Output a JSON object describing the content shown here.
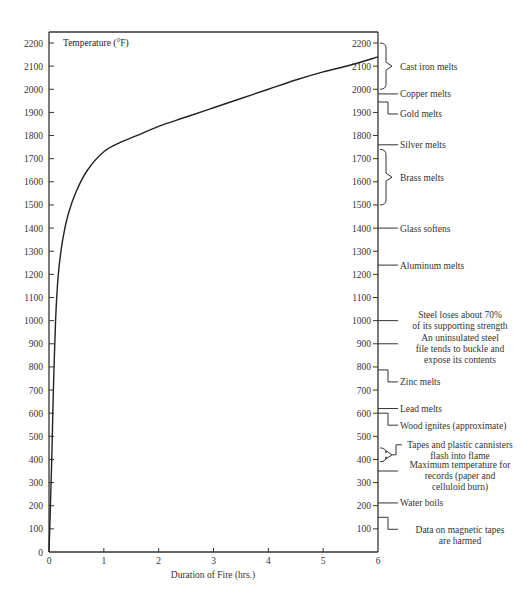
{
  "chart_data": {
    "type": "line",
    "title": "Temperature (°F)",
    "xlabel": "Duration of Fire (hrs.)",
    "ylabel": "Temperature (°F)",
    "xlim": [
      0,
      6
    ],
    "ylim": [
      0,
      2200
    ],
    "x_ticks": [
      "0",
      "1",
      "2",
      "3",
      "4",
      "5",
      "6"
    ],
    "y_ticks": [
      "0",
      "100",
      "200",
      "300",
      "400",
      "500",
      "600",
      "700",
      "800",
      "900",
      "1000",
      "1100",
      "1200",
      "1300",
      "1400",
      "1500",
      "1600",
      "1700",
      "1800",
      "1900",
      "2000",
      "2100",
      "2200"
    ],
    "right_y_ticks": [
      "100",
      "200",
      "300",
      "400",
      "500",
      "600",
      "700",
      "800",
      "900",
      "1000",
      "1100",
      "1200",
      "1300",
      "1400",
      "1500",
      "1600",
      "1700",
      "1800",
      "1900",
      "2000",
      "2100",
      "2200"
    ],
    "grid": false,
    "series": [
      {
        "name": "Fire temperature curve",
        "x": [
          0,
          0.02,
          0.05,
          0.08,
          0.12,
          0.17,
          0.25,
          0.35,
          0.5,
          0.7,
          1.0,
          1.3,
          1.6,
          2.0,
          2.5,
          3.0,
          3.5,
          4.0,
          4.5,
          5.0,
          5.5,
          6.0
        ],
        "y": [
          0,
          150,
          400,
          700,
          1000,
          1200,
          1350,
          1460,
          1560,
          1650,
          1730,
          1770,
          1800,
          1840,
          1880,
          1920,
          1960,
          2000,
          2040,
          2075,
          2105,
          2140
        ]
      }
    ],
    "annotations": [
      {
        "label": [
          "Cast iron melts"
        ],
        "kind": "brace",
        "range": [
          2000,
          2200
        ]
      },
      {
        "label": [
          "Copper melts"
        ],
        "kind": "line",
        "range": [
          1980,
          1980
        ]
      },
      {
        "label": [
          "Gold melts"
        ],
        "kind": "step",
        "range": [
          1945,
          1945
        ]
      },
      {
        "label": [
          "Silver melts"
        ],
        "kind": "line",
        "range": [
          1760,
          1760
        ]
      },
      {
        "label": [
          "Brass melts"
        ],
        "kind": "brace",
        "range": [
          1500,
          1740
        ]
      },
      {
        "label": [
          "Glass softens"
        ],
        "kind": "line",
        "range": [
          1400,
          1400
        ]
      },
      {
        "label": [
          "Aluminum melts"
        ],
        "kind": "line",
        "range": [
          1240,
          1240
        ]
      },
      {
        "label": [
          "Steel loses about 70%",
          "of its supporting strength"
        ],
        "kind": "line",
        "range": [
          1000,
          1000
        ]
      },
      {
        "label": [
          "An uninsulated steel",
          "file tends to buckle and",
          "expose its contents"
        ],
        "kind": "line",
        "range": [
          900,
          900
        ]
      },
      {
        "label": [
          "Zinc melts"
        ],
        "kind": "step",
        "range": [
          787,
          787
        ]
      },
      {
        "label": [
          "Lead melts"
        ],
        "kind": "line",
        "range": [
          620,
          620
        ]
      },
      {
        "label": [
          "Wood ignites (approximate)"
        ],
        "kind": "step",
        "range": [
          600,
          600
        ]
      },
      {
        "label": [
          "Tapes and plastic cannisters",
          "flash into flame"
        ],
        "kind": "brace",
        "range": [
          390,
          450
        ]
      },
      {
        "label": [
          "Maximum temperature for",
          "records (paper and",
          "celluloid burn)"
        ],
        "kind": "line",
        "range": [
          350,
          350
        ]
      },
      {
        "label": [
          "Water boils"
        ],
        "kind": "line",
        "range": [
          212,
          212
        ]
      },
      {
        "label": [
          "Data on magnetic tapes",
          "are harmed"
        ],
        "kind": "step",
        "range": [
          150,
          150
        ]
      }
    ]
  }
}
